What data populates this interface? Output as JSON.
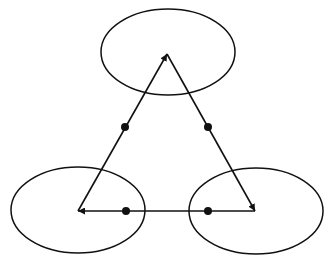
{
  "diagram": {
    "type": "directed-cycle",
    "background": "#ffffff",
    "stroke_color": "#111111",
    "nodes": [
      {
        "id": "top",
        "cx": 168,
        "cy": 52,
        "rx": 67,
        "ry": 43,
        "vertex": [
          167,
          54
        ]
      },
      {
        "id": "bottom-left",
        "cx": 78,
        "cy": 210,
        "rx": 67,
        "ry": 43,
        "vertex": [
          78,
          211
        ]
      },
      {
        "id": "bottom-right",
        "cx": 256,
        "cy": 211,
        "rx": 67,
        "ry": 43,
        "vertex": [
          255,
          211
        ]
      }
    ],
    "edges": [
      {
        "from": "bottom-left",
        "to": "top",
        "dot": [
          125,
          127
        ]
      },
      {
        "from": "top",
        "to": "bottom-right",
        "dot": [
          208,
          127
        ]
      },
      {
        "from": "bottom-right",
        "to": "bottom-left",
        "dot": [
          208,
          211
        ],
        "dot2": [
          126,
          211
        ]
      }
    ]
  }
}
